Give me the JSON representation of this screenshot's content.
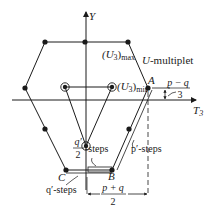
{
  "axes": {
    "y_label": "Y",
    "x_label": "T",
    "x_label_sub": "3"
  },
  "labels": {
    "u3_max_main": "(U",
    "u3_max_sub": "3",
    "u3_max_close": ")",
    "u3_max_tag": "max",
    "u3_min_main": "(U",
    "u3_min_sub": "3",
    "u3_min_close": ")",
    "u3_min_tag": "min",
    "multiplet_u": "U",
    "multiplet_rest": "-multiplet",
    "point_a": "A",
    "point_b": "B",
    "point_c": "C",
    "frac_pq_minus_num": "p − q",
    "frac_pq_minus_den": "3",
    "frac_pq_plus_num": "p + q",
    "frac_pq_plus_den": "2",
    "qhalf_num": "q′",
    "qhalf_den": "2",
    "qhalf_steps": "-steps",
    "pprime_steps": "p′-steps",
    "qprime_steps": "q′-steps"
  },
  "colors": {
    "ink": "#1a1a1a",
    "background": "#ffffff"
  }
}
